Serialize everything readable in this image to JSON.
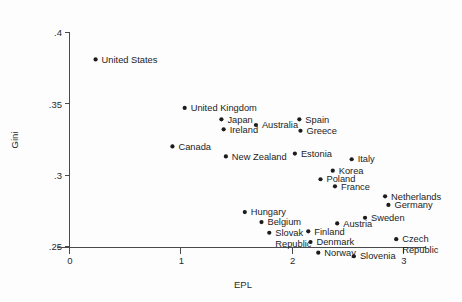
{
  "chart_data": {
    "type": "scatter",
    "title": "",
    "xlabel": "EPL",
    "ylabel": "Gini",
    "xlim": [
      -0.12,
      3.2
    ],
    "ylim": [
      0.2435,
      0.407
    ],
    "xticks": [
      "0",
      "1",
      "2",
      "3"
    ],
    "xtick_values": [
      0,
      1,
      2,
      3
    ],
    "yticks": [
      ".25",
      ".3",
      ".35",
      ".4"
    ],
    "ytick_values": [
      0.25,
      0.3,
      0.35,
      0.4
    ],
    "grid": false,
    "legend": false,
    "points": [
      {
        "label": "United States",
        "x": 0.23,
        "y": 0.3815,
        "lx": 6,
        "ly": 3.2
      },
      {
        "label": "United Kingdom",
        "x": 1.03,
        "y": 0.3475,
        "lx": 6,
        "ly": 3.2
      },
      {
        "label": "Japan",
        "x": 1.36,
        "y": 0.3395,
        "lx": 6,
        "ly": 3.2
      },
      {
        "label": "Ireland",
        "x": 1.38,
        "y": 0.3325,
        "lx": 6,
        "ly": 3.2
      },
      {
        "label": "Canada",
        "x": 0.92,
        "y": 0.3205,
        "lx": 6,
        "ly": 3.2
      },
      {
        "label": "New Zealand",
        "x": 1.4,
        "y": 0.3135,
        "lx": 6,
        "ly": 3.2
      },
      {
        "label": "Australia",
        "x": 1.67,
        "y": 0.3355,
        "lx": 6,
        "ly": 3.2
      },
      {
        "label": "Spain",
        "x": 2.06,
        "y": 0.3395,
        "lx": 6,
        "ly": 3.2
      },
      {
        "label": "Greece",
        "x": 2.07,
        "y": 0.3315,
        "lx": 6,
        "ly": 3.2
      },
      {
        "label": "Estonia",
        "x": 2.02,
        "y": 0.3155,
        "lx": 6,
        "ly": 3.2
      },
      {
        "label": "Italy",
        "x": 2.53,
        "y": 0.3115,
        "lx": 6,
        "ly": 3.2
      },
      {
        "label": "Korea",
        "x": 2.36,
        "y": 0.3035,
        "lx": 6,
        "ly": 3.2
      },
      {
        "label": "Poland",
        "x": 2.25,
        "y": 0.2975,
        "lx": 6,
        "ly": 3.2
      },
      {
        "label": "France",
        "x": 2.38,
        "y": 0.2925,
        "lx": 6,
        "ly": 3.2
      },
      {
        "label": "Netherlands",
        "x": 2.83,
        "y": 0.2855,
        "lx": 6,
        "ly": 3.2
      },
      {
        "label": "Germany",
        "x": 2.86,
        "y": 0.2795,
        "lx": 6,
        "ly": 3.2
      },
      {
        "label": "Sweden",
        "x": 2.65,
        "y": 0.2705,
        "lx": 6,
        "ly": 3.2
      },
      {
        "label": "Hungary",
        "x": 1.57,
        "y": 0.2745,
        "lx": 6,
        "ly": 3.2
      },
      {
        "label": "Belgium",
        "x": 1.72,
        "y": 0.2675,
        "lx": 6,
        "ly": 3.2
      },
      {
        "label": "Austria",
        "x": 2.4,
        "y": 0.2665,
        "lx": 6,
        "ly": 3.2
      },
      {
        "label": "Finland",
        "x": 2.14,
        "y": 0.261,
        "lx": 6,
        "ly": 3.2
      },
      {
        "label": "Slovak",
        "x": 1.79,
        "y": 0.26,
        "lx": 6,
        "ly": 3.2
      },
      {
        "label": "Denmark",
        "x": 2.16,
        "y": 0.2535,
        "lx": 6,
        "ly": 3.2
      },
      {
        "label": "Norway",
        "x": 2.23,
        "y": 0.246,
        "lx": 6,
        "ly": 3.2
      },
      {
        "label": "Slovenia",
        "x": 2.55,
        "y": 0.2435,
        "lx": 6,
        "ly": 3.2
      },
      {
        "label": "Czech",
        "x": 2.93,
        "y": 0.2555,
        "lx": 6,
        "ly": 3.2
      }
    ],
    "wrapped_labels": [
      {
        "label": "Republic",
        "x": 1.79,
        "y": 0.26,
        "dx": 6,
        "dy": 14
      },
      {
        "label": "Republic",
        "x": 2.93,
        "y": 0.2555,
        "dx": 6,
        "dy": 14
      }
    ]
  }
}
